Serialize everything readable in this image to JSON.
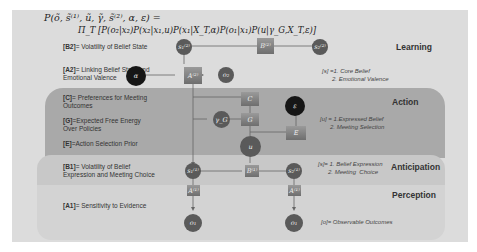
{
  "formula": {
    "line1": "P(õ, s̃⁽¹⁾, ũ, γ̃, s̃⁽²⁾, α, ε) =",
    "line2": "Π_T [P(o₂|x₂)P(x₂|x₁,u)P(x₁|X_T,α)P(o₁|x₁)P(u|γ_G,X_T,ε)]"
  },
  "sections": {
    "learning": "Learning",
    "action": "Action",
    "anticipation": "Anticipation",
    "perception": "Perception"
  },
  "labels": {
    "b2": {
      "key": "[B2]",
      "text": "= Volatility of Belief State"
    },
    "a2": {
      "key": "[A2]",
      "text": "= Linking Belief State and Emotional Valence"
    },
    "c": {
      "key": "[C]",
      "text": "= Preferences for Meeting Outcomes"
    },
    "g": {
      "key": "[G]",
      "text": "=Expected Free Energy Over Policies"
    },
    "e": {
      "key": "[E]",
      "text": "=Action Selection Prior"
    },
    "b1": {
      "key": "[B1]",
      "text": "= Volatility of Belief Expression and Meeting Choice"
    },
    "a1": {
      "key": "[A1]",
      "text": "= Sensitivity to Evidence"
    }
  },
  "notes": {
    "learning": "[s] =1. Core Belief\n      2. Emotional Valence",
    "action": "[u] = 1.Expressed Belief\n      2. Meeting Selection",
    "anticipation": "[s]= 1. Belief Expression\n      2. Meeting  Choice",
    "perception": "[o]= Observable Outcomes"
  },
  "nodes": {
    "s2_t": "s₁⁽²⁾",
    "b2_box": "B⁽²⁾",
    "s2_t1": "s₂⁽²⁾",
    "alpha": "α",
    "a2_box": "A⁽²⁾",
    "o2": "o₂",
    "c_box": "C",
    "gamma": "γ_G",
    "g_box": "G",
    "epsilon": "ε",
    "e_box": "E",
    "u": "u",
    "s1_t": "s₁⁽¹⁾",
    "b1_box": "B⁽¹⁾",
    "s1_t1": "s₂⁽¹⁾",
    "a1_box_left": "A⁽¹⁾",
    "a1_box_right": "A⁽¹⁾",
    "o1_left": "o₁",
    "o1_right": "o₁"
  }
}
